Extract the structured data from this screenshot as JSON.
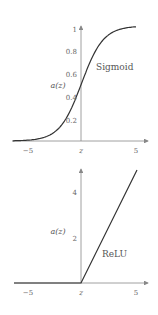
{
  "chart_data": [
    {
      "type": "line",
      "title": "Sigmoid",
      "xlabel": "z",
      "ylabel": "a(z)",
      "xlim": [
        -5,
        5
      ],
      "ylim": [
        0,
        1
      ],
      "x_ticks": [
        "−5",
        "5"
      ],
      "y_ticks": [
        "0.2",
        "0.4",
        "0.6",
        "0.8",
        "1"
      ],
      "grid": false,
      "series": [
        {
          "name": "Sigmoid",
          "x": [
            -5,
            -4,
            -3,
            -2,
            -1,
            0,
            1,
            2,
            3,
            4,
            5
          ],
          "values": [
            0.007,
            0.018,
            0.047,
            0.119,
            0.269,
            0.5,
            0.731,
            0.881,
            0.953,
            0.982,
            0.993
          ]
        }
      ]
    },
    {
      "type": "line",
      "title": "ReLU",
      "xlabel": "z",
      "ylabel": "a(z)",
      "xlim": [
        -5,
        5
      ],
      "ylim": [
        0,
        5
      ],
      "x_ticks": [
        "−5",
        "5"
      ],
      "y_ticks": [
        "2",
        "4"
      ],
      "grid": false,
      "series": [
        {
          "name": "ReLU",
          "x": [
            -5,
            0,
            5
          ],
          "values": [
            0,
            0,
            5
          ]
        }
      ]
    }
  ],
  "labels": {
    "top": {
      "name": "Sigmoid",
      "ylabel": "a(z)",
      "xlabel": "z",
      "x_min": "−5",
      "x_max": "5",
      "y_ticks": [
        "0.2",
        "0.4",
        "0.6",
        "0.8",
        "1"
      ]
    },
    "bottom": {
      "name": "ReLU",
      "ylabel": "a(z)",
      "xlabel": "z",
      "x_min": "−5",
      "x_max": "5",
      "y_ticks": [
        "2",
        "4"
      ]
    }
  }
}
